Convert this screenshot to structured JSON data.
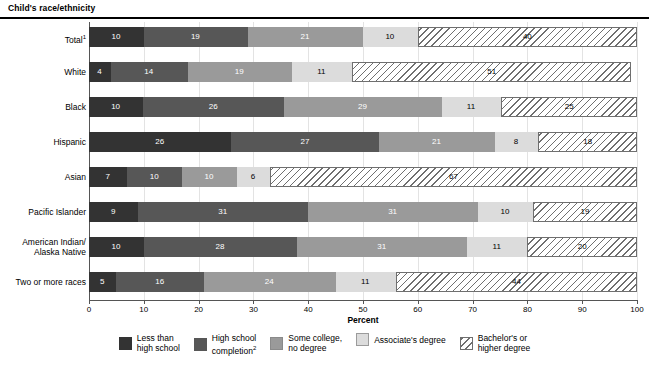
{
  "header": {
    "title": "Child's race/ethnicity"
  },
  "axis": {
    "x_title": "Percent",
    "ticks": [
      "0",
      "10",
      "20",
      "30",
      "40",
      "50",
      "60",
      "70",
      "80",
      "90",
      "100"
    ]
  },
  "legend": {
    "items": [
      {
        "id": "less-than-high-school",
        "label": "Less than\nhigh school",
        "color": "#333333",
        "swatch": "sw0"
      },
      {
        "id": "high-school-completion",
        "label": "High school\ncompletion",
        "sup": "2",
        "color": "#575757",
        "swatch": "sw1"
      },
      {
        "id": "some-college-no-degree",
        "label": "Some college,\nno degree",
        "color": "#9a9a9a",
        "swatch": "sw2"
      },
      {
        "id": "associates-degree",
        "label": "Associate's degree",
        "color": "#dcdcdc",
        "swatch": "sw3"
      },
      {
        "id": "bachelors-or-higher",
        "label": "Bachelor's or\nhigher degree",
        "color": "#ffffff",
        "swatch": "sw4"
      }
    ]
  },
  "chart_data": {
    "type": "bar",
    "orientation": "horizontal",
    "stacked": true,
    "normalized_percent": true,
    "title": "Child's race/ethnicity",
    "xlabel": "Percent",
    "ylabel": "",
    "xlim": [
      0,
      100
    ],
    "xticks": [
      0,
      10,
      20,
      30,
      40,
      50,
      60,
      70,
      80,
      90,
      100
    ],
    "grid": "vertical",
    "legend_position": "bottom",
    "categories": [
      "Total",
      "White",
      "Black",
      "Hispanic",
      "Asian",
      "Pacific Islander",
      "American Indian/\nAlaska Native",
      "Two or more races"
    ],
    "category_footnotes": [
      "1",
      "",
      "",
      "",
      "",
      "",
      "",
      ""
    ],
    "series": [
      {
        "name": "Less than high school",
        "color": "#333333",
        "values": [
          10,
          4,
          10,
          26,
          7,
          9,
          10,
          5
        ]
      },
      {
        "name": "High school completion",
        "color": "#575757",
        "values": [
          19,
          14,
          26,
          27,
          10,
          31,
          28,
          16
        ]
      },
      {
        "name": "Some college, no degree",
        "color": "#9a9a9a",
        "values": [
          21,
          19,
          29,
          21,
          10,
          31,
          31,
          24
        ]
      },
      {
        "name": "Associate's degree",
        "color": "#dcdcdc",
        "values": [
          10,
          11,
          11,
          8,
          6,
          10,
          11,
          11
        ]
      },
      {
        "name": "Bachelor's or higher degree",
        "color": "#ffffff",
        "values": [
          40,
          51,
          25,
          18,
          67,
          19,
          20,
          44
        ]
      }
    ]
  }
}
